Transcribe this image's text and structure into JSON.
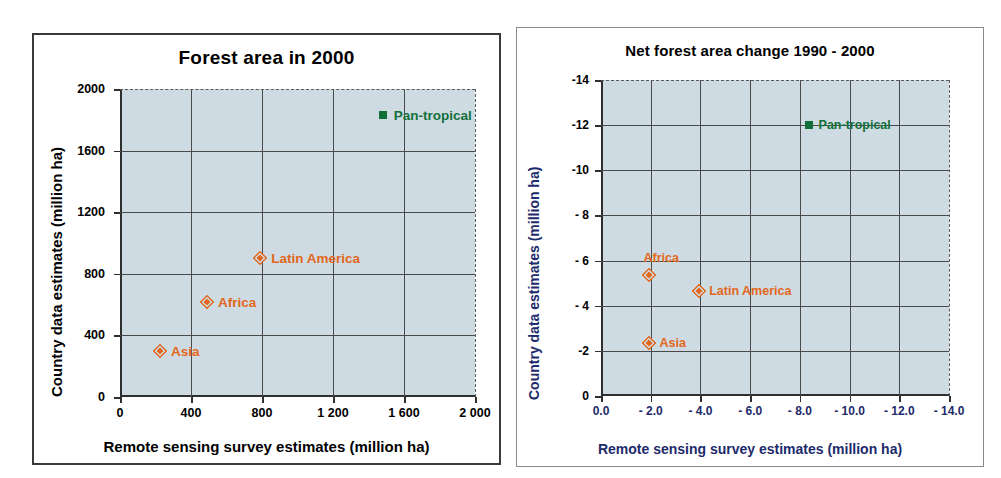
{
  "chart_data": [
    {
      "type": "scatter",
      "panel": "left",
      "title": "Forest area in 2000",
      "xlabel": "Remote sensing survey estimates (million ha)",
      "ylabel": "Country data estimates (million ha)",
      "xlim": [
        0,
        2000
      ],
      "ylim": [
        0,
        2000
      ],
      "grid": true,
      "xticks": [
        "0",
        "400",
        "800",
        "1 200",
        "1 600",
        "2 000"
      ],
      "xtick_values": [
        0,
        400,
        800,
        1200,
        1600,
        2000
      ],
      "yticks": [
        "0",
        "400",
        "800",
        "1200",
        "1600",
        "2000"
      ],
      "ytick_values": [
        0,
        400,
        800,
        1200,
        1600,
        2000
      ],
      "points": [
        {
          "label": "Pan-tropical",
          "x": 1480,
          "y": 1830,
          "marker": "square",
          "color": "#11703a",
          "label_side": "right"
        },
        {
          "label": "Latin America",
          "x": 790,
          "y": 900,
          "marker": "diamond",
          "color": "#e2671c",
          "label_side": "right"
        },
        {
          "label": "Africa",
          "x": 490,
          "y": 620,
          "marker": "diamond",
          "color": "#e2671c",
          "label_side": "right"
        },
        {
          "label": "Asia",
          "x": 225,
          "y": 300,
          "marker": "diamond",
          "color": "#e2671c",
          "label_side": "right"
        }
      ]
    },
    {
      "type": "scatter",
      "panel": "right",
      "title": "Net forest area change 1990 - 2000",
      "xlabel": "Remote sensing survey estimates (million ha)",
      "ylabel": "Country data estimates (million ha)",
      "xlim": [
        0,
        -14
      ],
      "ylim": [
        0,
        -14
      ],
      "grid": true,
      "xticks": [
        "0.0",
        "- 2.0",
        "- 4.0",
        "- 6.0",
        "- 8.0",
        "- 10.0",
        "- 12.0",
        "- 14.0"
      ],
      "xtick_values": [
        0,
        -2,
        -4,
        -6,
        -8,
        -10,
        -12,
        -14
      ],
      "yticks": [
        "0",
        "-2",
        "- 4",
        "- 6",
        "- 8",
        "-10",
        "-12",
        "-14"
      ],
      "ytick_values": [
        0,
        -2,
        -4,
        -6,
        -8,
        -10,
        -12,
        -14
      ],
      "points": [
        {
          "label": "Pan-tropical",
          "x": -8.35,
          "y": -12.0,
          "marker": "square",
          "color": "#11703a",
          "label_side": "right"
        },
        {
          "label": "Africa",
          "x": -1.95,
          "y": -5.35,
          "marker": "diamond",
          "color": "#e2671c",
          "label_side": "above"
        },
        {
          "label": "Latin America",
          "x": -3.95,
          "y": -4.65,
          "marker": "diamond",
          "color": "#e2671c",
          "label_side": "right"
        },
        {
          "label": "Asia",
          "x": -1.95,
          "y": -2.35,
          "marker": "diamond",
          "color": "#e2671c",
          "label_side": "right"
        }
      ]
    }
  ],
  "colors": {
    "plot_background": "#cfdbe2",
    "grid": "#4a4a4a",
    "marker_orange": "#e2671c",
    "marker_green": "#11703a",
    "right_axis_title": "#1d2a6b",
    "text": "#000000"
  }
}
